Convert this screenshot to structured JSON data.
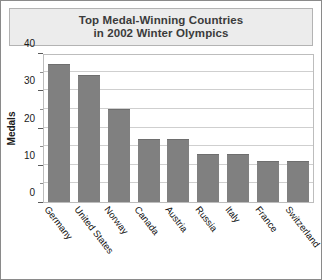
{
  "title": {
    "line1": "Top Medal-Winning Countries",
    "line2": "in 2002 Winter Olympics"
  },
  "axis": {
    "y_title": "Medals",
    "y_ticks_major": [
      "0",
      "10",
      "20",
      "30",
      "40"
    ],
    "y_ticks_minor": [
      "5",
      "15",
      "25",
      "35"
    ]
  },
  "colors": {
    "bar_fill": "#808080",
    "bar_edge": "#6e6e6e",
    "gridline": "#cfcfcf",
    "title_box_bg": "#ececec",
    "frame_border": "#8a8a8a",
    "text": "#1a1a1a",
    "title_text": "#3b3b3b"
  },
  "chart_data": {
    "type": "bar",
    "title": "Top Medal-Winning Countries in 2002 Winter Olympics",
    "xlabel": "",
    "ylabel": "Medals",
    "ylim": [
      0,
      40
    ],
    "ytick_interval": 10,
    "yminor_interval": 5,
    "grid": true,
    "legend": false,
    "categories": [
      "Germany",
      "United States",
      "Norway",
      "Canada",
      "Austria",
      "Russia",
      "Italy",
      "France",
      "Switzerland"
    ],
    "values": [
      37,
      34,
      25,
      17,
      17,
      13,
      13,
      11,
      11
    ]
  }
}
